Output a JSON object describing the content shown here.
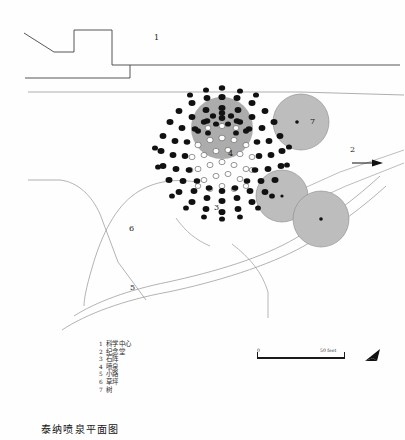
{
  "document": {
    "title": "泰纳喷泉平面图",
    "type": "site-plan",
    "background_color": "#fefefe",
    "ink_color": "#1a1a1a"
  },
  "map_labels": [
    {
      "id": "1",
      "text": "1",
      "x": 155,
      "y": 38,
      "note": "Science Center building edge"
    },
    {
      "id": "2",
      "text": "2",
      "x": 352,
      "y": 150,
      "note": "direction to Memorial Hall"
    },
    {
      "id": "3",
      "text": "3",
      "x": 215,
      "y": 208,
      "note": "stone circle"
    },
    {
      "id": "4",
      "text": "4",
      "x": 229,
      "y": 154,
      "note": "fountain centre"
    },
    {
      "id": "5",
      "text": "5",
      "x": 131,
      "y": 288,
      "note": "path"
    },
    {
      "id": "6",
      "text": "6",
      "x": 130,
      "y": 229,
      "note": "lawn"
    },
    {
      "id": "7",
      "text": "7",
      "x": 311,
      "y": 122,
      "note": "tree canopy"
    }
  ],
  "legend": {
    "items": [
      {
        "num": "1",
        "label": "科学中心"
      },
      {
        "num": "2",
        "label": "纪念堂"
      },
      {
        "num": "3",
        "label": "石阵"
      },
      {
        "num": "4",
        "label": "喷泉"
      },
      {
        "num": "5",
        "label": "小路"
      },
      {
        "num": "6",
        "label": "草坪"
      },
      {
        "num": "7",
        "label": "树"
      }
    ]
  },
  "scalebar": {
    "start_label": "0",
    "end_label": "50 feet"
  },
  "north_arrow": {
    "name": "north-arrow"
  },
  "drawing": {
    "stone_field": {
      "center_x": 222,
      "center_y": 155,
      "outer_radius": 62,
      "dot_color": "#111111",
      "inner_outline_radius": 34,
      "shade_circle": {
        "cx": 222,
        "cy": 128,
        "r": 30,
        "fill": "#9a9a9a"
      }
    },
    "trees": [
      {
        "cx": 301,
        "cy": 122,
        "r": 28,
        "fill": "#bdbdbd"
      },
      {
        "cx": 282,
        "cy": 196,
        "r": 26,
        "fill": "#bdbdbd"
      },
      {
        "cx": 321,
        "cy": 219,
        "r": 28,
        "fill": "#bdbdbd"
      }
    ]
  }
}
